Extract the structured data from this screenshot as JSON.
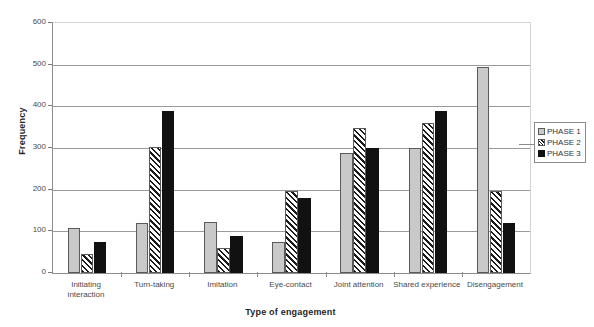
{
  "chart_data": {
    "type": "bar",
    "title": "",
    "xlabel": "Type of engagement",
    "ylabel": "Frequency",
    "ylim": [
      0,
      600
    ],
    "ytick_step": 100,
    "yticks": [
      0,
      100,
      200,
      300,
      400,
      500,
      600
    ],
    "grid": true,
    "legend_position": "right",
    "categories": [
      "Initiating interaction",
      "Turn-taking",
      "Imitation",
      "Eye-contact",
      "Joint attention",
      "Shared experience",
      "Disengagement"
    ],
    "series": [
      {
        "name": "PHASE 1",
        "color": "#c9c9c9",
        "pattern": "solid-light-gray",
        "values": [
          107,
          120,
          122,
          75,
          288,
          300,
          495
        ]
      },
      {
        "name": "PHASE 2",
        "color": "#1a1a1a",
        "pattern": "diagonal-hatch",
        "values": [
          45,
          302,
          60,
          197,
          347,
          360,
          197
        ]
      },
      {
        "name": "PHASE 3",
        "color": "#111111",
        "pattern": "solid-black",
        "values": [
          75,
          390,
          90,
          180,
          300,
          390,
          120
        ]
      }
    ]
  },
  "axes": {
    "y_title": "Frequency",
    "x_title": "Type of engagement",
    "y_tick_labels": [
      "600",
      "500",
      "400",
      "300",
      "200",
      "100",
      "0"
    ]
  },
  "legend": {
    "items": [
      {
        "label": "PHASE 1"
      },
      {
        "label": "PHASE 2"
      },
      {
        "label": "PHASE 3"
      }
    ]
  }
}
